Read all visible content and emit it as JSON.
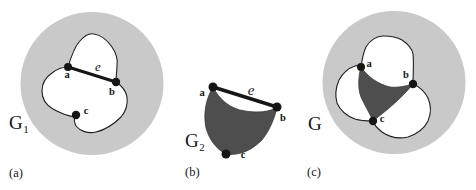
{
  "colors": {
    "background": "#ffffff",
    "disk": "#c9c9c9",
    "face": "#ffffff",
    "fat": "#4e4e4e",
    "ink": "#161616",
    "outline": "#1f1f1f"
  },
  "figures": {
    "a": {
      "caption": "(a)",
      "graph_base": "G",
      "graph_sub": "1",
      "vertex_a": "a",
      "vertex_b": "b",
      "vertex_c": "c",
      "edge_e": "e"
    },
    "b": {
      "caption": "(b)",
      "graph_base": "G",
      "graph_sub": "2",
      "vertex_a": "a",
      "vertex_b": "b",
      "vertex_c": "c",
      "edge_e": "e"
    },
    "c": {
      "caption": "(c)",
      "graph_base": "G",
      "graph_sub": "",
      "vertex_a": "a",
      "vertex_b": "b",
      "vertex_c": "c"
    }
  }
}
